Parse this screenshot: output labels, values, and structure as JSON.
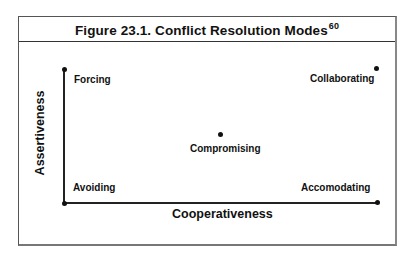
{
  "figure": {
    "title": "Figure 23.1.  Conflict Resolution Modes",
    "footnote": "60"
  },
  "axes": {
    "x_label": "Cooperativeness",
    "y_label": "Assertiveness"
  },
  "modes": [
    {
      "name": "Forcing",
      "position": "high assertiveness, low cooperativeness"
    },
    {
      "name": "Collaborating",
      "position": "high assertiveness, high cooperativeness"
    },
    {
      "name": "Compromising",
      "position": "medium assertiveness, medium cooperativeness"
    },
    {
      "name": "Avoiding",
      "position": "low assertiveness, low cooperativeness"
    },
    {
      "name": "Accomodating",
      "position": "low assertiveness, high cooperativeness"
    }
  ]
}
